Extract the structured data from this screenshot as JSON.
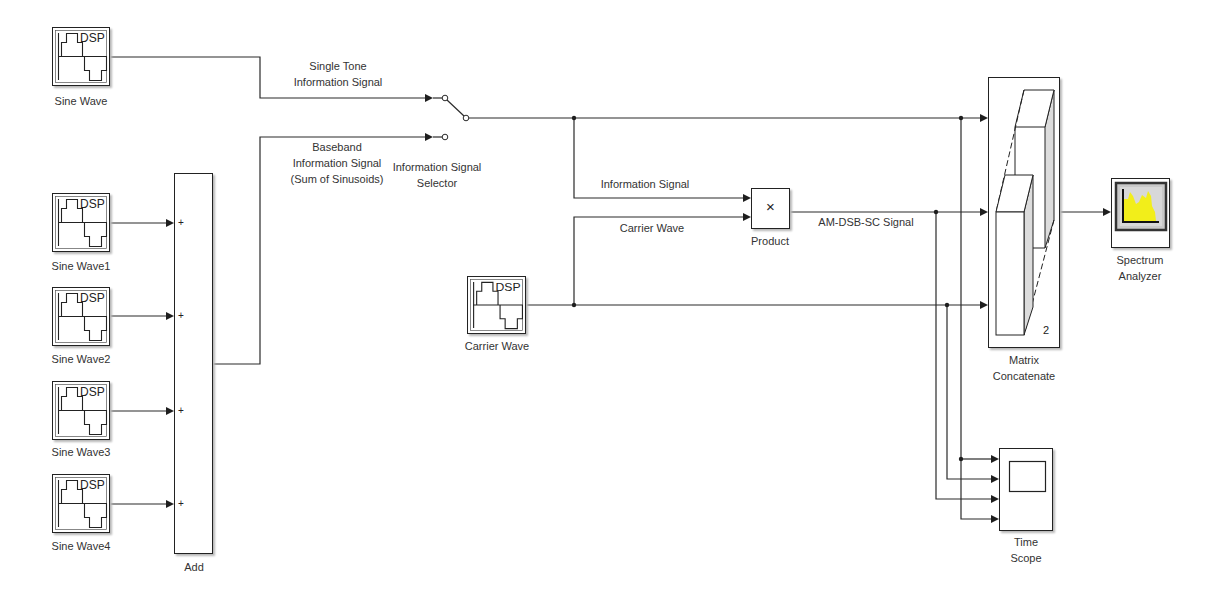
{
  "diagram": {
    "blocks": {
      "sine_wave": {
        "label": "Sine Wave",
        "icon_text": "DSP"
      },
      "sine_wave1": {
        "label": "Sine Wave1",
        "icon_text": "DSP"
      },
      "sine_wave2": {
        "label": "Sine Wave2",
        "icon_text": "DSP"
      },
      "sine_wave3": {
        "label": "Sine Wave3",
        "icon_text": "DSP"
      },
      "sine_wave4": {
        "label": "Sine Wave4",
        "icon_text": "DSP"
      },
      "add": {
        "label": "Add",
        "port_signs": [
          "+",
          "+",
          "+",
          "+"
        ]
      },
      "switch": {
        "label_lines": [
          "Information Signal",
          "Selector"
        ]
      },
      "carrier_wave": {
        "label": "Carrier Wave",
        "icon_text": "DSP"
      },
      "product": {
        "label": "Product",
        "symbol": "×"
      },
      "matrix_concatenate": {
        "label_lines": [
          "Matrix",
          "Concatenate"
        ],
        "num_inputs": "2"
      },
      "spectrum_analyzer": {
        "label_lines": [
          "Spectrum",
          "Analyzer"
        ]
      },
      "time_scope": {
        "label_lines": [
          "Time",
          "Scope"
        ]
      }
    },
    "signals": {
      "single_tone": [
        "Single Tone",
        "Information Signal"
      ],
      "baseband": [
        "Baseband",
        "Information Signal",
        "(Sum of Sinusoids)"
      ],
      "information_signal": "Information Signal",
      "carrier_wave": "Carrier Wave",
      "am_dsb_sc": "AM-DSB-SC Signal"
    }
  },
  "colors": {
    "background": "#ffffff",
    "line": "#2a2a2a",
    "block_shadow": "#b8b8b8",
    "spectrum_fill": "#f2ee1a",
    "spectrum_screen": "#c9c9c9",
    "concat_shade": "#dcdcdc"
  }
}
